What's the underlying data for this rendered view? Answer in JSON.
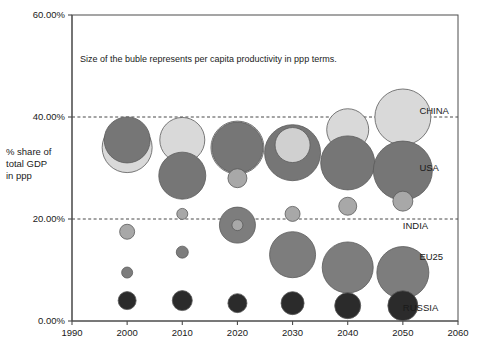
{
  "chart_data": {
    "type": "scatter",
    "subtype": "bubble",
    "title": "",
    "annotation": "Size of the buble represents per capita productivity in ppp terms.",
    "xlabel": "",
    "ylabel": "% share of total GDP in ppp",
    "ylabel_lines": [
      "% share of",
      "total GDP",
      "in ppp"
    ],
    "xlim": [
      1990,
      2060
    ],
    "ylim": [
      0,
      60
    ],
    "x_ticks": [
      1990,
      2000,
      2010,
      2020,
      2030,
      2040,
      2050,
      2060
    ],
    "x_tick_labels": [
      "1990",
      "2000",
      "2010",
      "2020",
      "2030",
      "2040",
      "2050",
      "2060"
    ],
    "y_ticks": [
      0,
      20,
      40,
      60
    ],
    "y_tick_labels": [
      "0.00%",
      "20.00%",
      "40.00%",
      "60.00%"
    ],
    "grid": "horizontal-dashed-at-20-and-40",
    "legend_position": "right-inline-series-labels",
    "size_meaning": "per capita productivity in ppp terms",
    "series": [
      {
        "name": "CHINA",
        "label": "CHINA",
        "color": "#d9d9d9",
        "label_x": 2053,
        "label_y": 40.5,
        "points": [
          {
            "x": 2000,
            "y": 34.0,
            "r": 25.0
          },
          {
            "x": 2010,
            "y": 35.5,
            "r": 22.5
          },
          {
            "x": 2020,
            "y": 34.0,
            "r": 26.5
          },
          {
            "x": 2030,
            "y": 34.5,
            "r": 17.5
          },
          {
            "x": 2040,
            "y": 37.5,
            "r": 21.0
          },
          {
            "x": 2050,
            "y": 40.0,
            "r": 28.0
          }
        ]
      },
      {
        "name": "USA",
        "label": "USA",
        "color": "#767676",
        "label_x": 2053,
        "label_y": 29.5,
        "points": [
          {
            "x": 2000,
            "y": 35.5,
            "r": 23.0
          },
          {
            "x": 2010,
            "y": 28.5,
            "r": 23.5
          },
          {
            "x": 2020,
            "y": 34.0,
            "r": 25.5
          },
          {
            "x": 2030,
            "y": 33.0,
            "r": 28.0
          },
          {
            "x": 2040,
            "y": 31.0,
            "r": 27.0
          },
          {
            "x": 2050,
            "y": 29.5,
            "r": 29.5
          }
        ]
      },
      {
        "name": "INDIA",
        "label": "INDIA",
        "color": "#a8a8a8",
        "label_x": 2050,
        "label_y": 18.0,
        "points": [
          {
            "x": 2000,
            "y": 17.5,
            "r": 7.5
          },
          {
            "x": 2010,
            "y": 21.0,
            "r": 5.5
          },
          {
            "x": 2020,
            "y": 28.0,
            "r": 9.5
          },
          {
            "x": 2030,
            "y": 21.0,
            "r": 7.5
          },
          {
            "x": 2040,
            "y": 22.5,
            "r": 9.0
          },
          {
            "x": 2050,
            "y": 23.5,
            "r": 10.0
          }
        ]
      },
      {
        "name": "EU25",
        "label": "EU25",
        "color": "#7d7d7d",
        "label_x": 2053,
        "label_y": 12.0,
        "points": [
          {
            "x": 2000,
            "y": 9.5,
            "r": 5.5
          },
          {
            "x": 2010,
            "y": 13.5,
            "r": 6.0
          },
          {
            "x": 2020,
            "y": 18.8,
            "r": 18.0
          },
          {
            "x": 2030,
            "y": 13.0,
            "r": 23.0
          },
          {
            "x": 2040,
            "y": 10.5,
            "r": 25.5
          },
          {
            "x": 2050,
            "y": 9.5,
            "r": 26.0
          }
        ]
      },
      {
        "name": "RUSSIA",
        "label": "RUSSIA",
        "color": "#2b2b2b",
        "label_x": 2050,
        "label_y": 2.0,
        "points": [
          {
            "x": 2000,
            "y": 4.0,
            "r": 9.0
          },
          {
            "x": 2010,
            "y": 4.0,
            "r": 10.0
          },
          {
            "x": 2020,
            "y": 3.5,
            "r": 9.5
          },
          {
            "x": 2030,
            "y": 3.5,
            "r": 11.5
          },
          {
            "x": 2040,
            "y": 3.0,
            "r": 13.0
          },
          {
            "x": 2050,
            "y": 3.0,
            "r": 15.0
          }
        ]
      }
    ],
    "inner_markers": [
      {
        "series": "INDIA",
        "x": 2020,
        "y": 18.8,
        "r": 5.5,
        "color": "#a8a8a8"
      },
      {
        "series": "CHINA",
        "x": 2030,
        "y": 34.5,
        "r": 17.5,
        "color": "#d0d0d0"
      }
    ],
    "colors": {
      "china": "#d9d9d9",
      "usa": "#767676",
      "india": "#a8a8a8",
      "eu25": "#7d7d7d",
      "russia": "#2b2b2b",
      "axis": "#4d4d4d",
      "grid": "#333333",
      "text": "#1a1a1a",
      "background": "#ffffff"
    }
  },
  "plot_geometry": {
    "left": 72,
    "right": 458,
    "top": 15,
    "bottom": 321
  }
}
